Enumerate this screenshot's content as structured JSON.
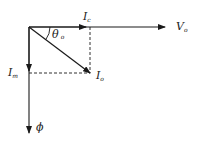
{
  "diagram": {
    "type": "phasor diagram",
    "colors": {
      "line": "#1a1a1a",
      "background": "#ffffff"
    },
    "phasors": [
      {
        "id": "Vo",
        "main": "V",
        "sub": "o",
        "direction": "horizontal-right"
      },
      {
        "id": "Ic",
        "main": "I",
        "sub": "c",
        "direction": "horizontal-right (in phase with V_o)"
      },
      {
        "id": "Io",
        "main": "I",
        "sub": "o",
        "direction": "diagonal down-right (resultant)"
      },
      {
        "id": "Im",
        "main": "I",
        "sub": "m",
        "direction": "vertical-down"
      },
      {
        "id": "Phi",
        "main": "ϕ",
        "sub": "",
        "direction": "vertical-down (in phase with I_m)"
      }
    ],
    "angle": {
      "main": "θ",
      "sub": "o",
      "between": "V_o and I_o"
    },
    "projections": [
      "dashed vertical from I_o tip to I_c",
      "dashed horizontal from I_o tip to I_m"
    ]
  }
}
